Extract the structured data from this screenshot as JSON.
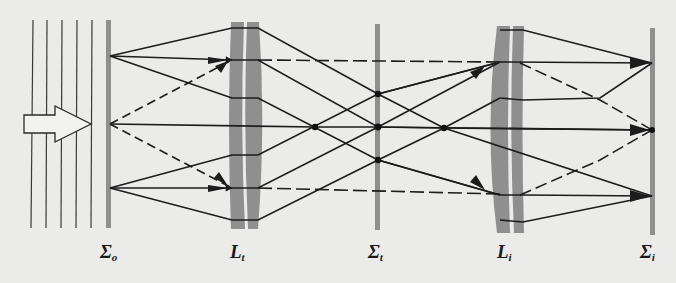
{
  "figure": {
    "type": "optical ray diagram",
    "colors": {
      "background": "#ebebea",
      "ray": "#1c1c1c",
      "optic": "#8f8f8f",
      "wavefront": "#3a3a3a"
    }
  },
  "labels": {
    "object_plane": {
      "main": "Σ",
      "sub": "o"
    },
    "transform_lens": {
      "main": "L",
      "sub": "t"
    },
    "transform_plane": {
      "main": "Σ",
      "sub": "t"
    },
    "imaging_lens": {
      "main": "L",
      "sub": "i"
    },
    "image_plane": {
      "main": "Σ",
      "sub": "i"
    }
  },
  "elements": {
    "wavefronts_x": [
      33,
      47,
      62,
      77,
      92
    ],
    "incident_arrow": "hollow block arrow pointing right",
    "object_plane_x": 108,
    "transform_lens_x": [
      230,
      265
    ],
    "transform_plane_x": 378,
    "imaging_lens_x": [
      488,
      523
    ],
    "image_plane_x": 652,
    "object_points_y": [
      56,
      124,
      188
    ],
    "focal_points": [
      [
        315,
        127
      ],
      [
        378,
        94
      ],
      [
        378,
        127
      ],
      [
        378,
        160
      ],
      [
        444,
        128
      ]
    ],
    "image_points_y": [
      63,
      130,
      196
    ]
  }
}
